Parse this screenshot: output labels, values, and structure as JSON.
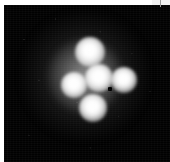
{
  "figure": {
    "kind": "detector-image",
    "modality": "grayscale intensity map",
    "width_px": 170,
    "height_px": 162,
    "background_color": "#010101",
    "margin_color": "#ffffff",
    "spot_color": "#ffffff",
    "halo_color": "#6e6e6e",
    "defect_color": "#000000"
  },
  "detector": {
    "panel": {
      "left_px": 4,
      "top_px": 5,
      "width_px": 166,
      "height_px": 157
    },
    "corner_notch": {
      "label": "page-edge-artifact",
      "width_px": 18,
      "height_px": 5,
      "color": "#f2f2f2"
    }
  },
  "chart_data": {
    "type": "scatter",
    "title": "",
    "subtitle": "",
    "xlabel": "",
    "ylabel": "",
    "grid": false,
    "legend": null,
    "xlim": [
      0,
      166
    ],
    "ylim": [
      0,
      157
    ],
    "colormap": "grayscale",
    "annotations": [],
    "series": [
      {
        "name": "bright-spots",
        "points": [
          {
            "id": "spot-top",
            "x": 86,
            "y": 47,
            "radius_px": 15,
            "peak_intensity": 255
          },
          {
            "id": "spot-left",
            "x": 70,
            "y": 80,
            "radius_px": 13,
            "peak_intensity": 252
          },
          {
            "id": "spot-center",
            "x": 95,
            "y": 73,
            "radius_px": 14,
            "peak_intensity": 248
          },
          {
            "id": "spot-right",
            "x": 120,
            "y": 75,
            "radius_px": 13,
            "peak_intensity": 245
          },
          {
            "id": "spot-bottom",
            "x": 89,
            "y": 103,
            "radius_px": 14,
            "peak_intensity": 250
          }
        ]
      },
      {
        "name": "diffuse-halo",
        "points": [
          {
            "id": "halo-inner",
            "x": 81,
            "y": 71,
            "radius_px": 37,
            "peak_intensity": 120
          },
          {
            "id": "halo-outer",
            "x": 81,
            "y": 71,
            "radius_px": 63,
            "peak_intensity": 70
          }
        ]
      },
      {
        "name": "defects",
        "points": [
          {
            "id": "dead-pixel",
            "x": 106,
            "y": 84,
            "radius_px": 2,
            "peak_intensity": 0
          }
        ]
      }
    ]
  }
}
